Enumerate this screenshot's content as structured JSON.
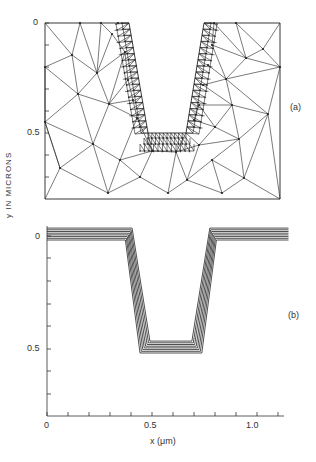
{
  "panel_a": {
    "label": "(a)",
    "description": "Triangular finite-element mesh of trench cross-section, refined near trench walls and bottom",
    "y_ticks": [
      "0",
      "0.5"
    ]
  },
  "panel_b": {
    "label": "(b)",
    "description": "Successive deposition profile contours along trench",
    "y_ticks": [
      "0",
      "0.5"
    ],
    "x_ticks": [
      "0",
      "0.5",
      "1.0"
    ],
    "xlabel": "x (μm)"
  },
  "ylabel": "y IN MICRONS",
  "chart_data": {
    "type": "line",
    "title": "",
    "xlabel": "x (μm)",
    "ylabel": "y IN MICRONS",
    "xlim": [
      0,
      1.15
    ],
    "ylim_inverted": [
      0.8,
      -0.05
    ],
    "x_ticks": [
      0,
      0.5,
      1.0
    ],
    "y_ticks": [
      0,
      0.5
    ],
    "series": [
      {
        "name": "profile 1",
        "x": [
          0,
          0.4,
          0.48,
          0.73,
          0.81,
          1.15
        ],
        "y": [
          -0.02,
          -0.02,
          0.47,
          0.47,
          -0.02,
          -0.02
        ]
      },
      {
        "name": "profile 8",
        "x": [
          0,
          0.37,
          0.45,
          0.76,
          0.84,
          1.15
        ],
        "y": [
          0.05,
          0.05,
          0.53,
          0.53,
          0.05,
          0.05
        ]
      }
    ],
    "legend": [
      "(a) mesh",
      "(b) profiles"
    ]
  }
}
